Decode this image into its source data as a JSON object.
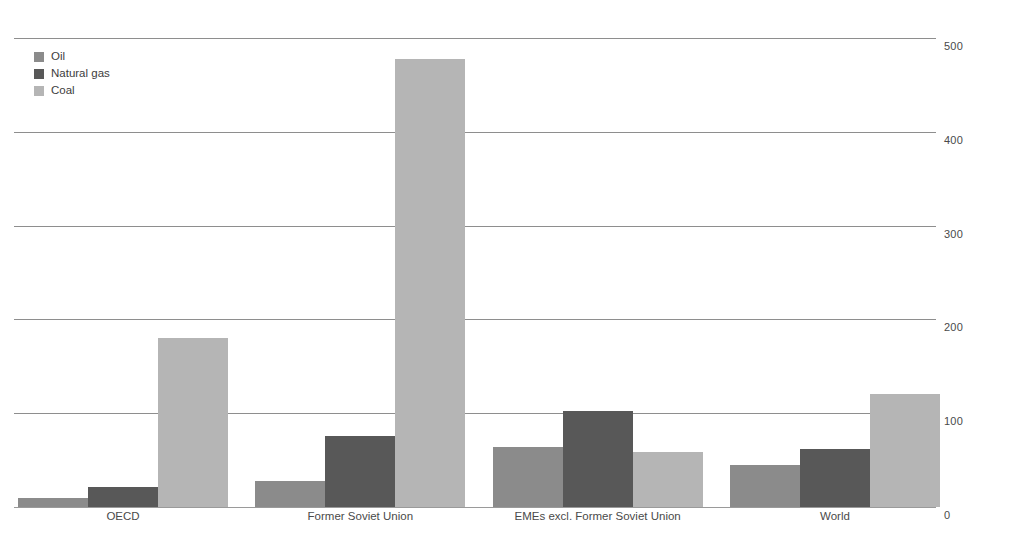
{
  "chart_data": {
    "type": "bar",
    "title": "",
    "subtitle": "",
    "xlabel": "",
    "ylabel": "",
    "categories": [
      "OECD",
      "Former Soviet Union",
      "EMEs excl. Former Soviet Union",
      "World"
    ],
    "series": [
      {
        "name": "Oil",
        "color": "#8b8b8b",
        "values": [
          10,
          28,
          64,
          45
        ]
      },
      {
        "name": "Natural gas",
        "color": "#585858",
        "values": [
          21,
          76,
          102,
          62
        ]
      },
      {
        "name": "Coal",
        "color": "#b5b5b5",
        "values": [
          180,
          478,
          59,
          120
        ]
      }
    ],
    "ylim": [
      0,
      500
    ],
    "yticks": [
      0,
      100,
      200,
      300,
      400,
      500
    ],
    "ytick_labels": [
      "0",
      "100",
      "200",
      "300",
      "400",
      "500"
    ],
    "y_axis_position": "right",
    "grid": true,
    "legend_position": "top-left",
    "legend_entries": [
      "Oil",
      "Natural gas",
      "Coal"
    ]
  }
}
